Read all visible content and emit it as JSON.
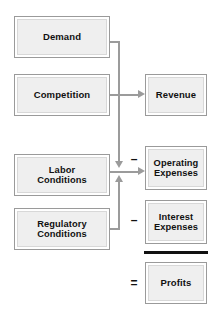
{
  "diagram": {
    "colors": {
      "box_fill": "#efefef",
      "box_border": "#9a9a9a",
      "box_inner_border": "#d8d8d8",
      "connector": "#9b9b9b",
      "text": "#111111",
      "sum_rule": "#111111",
      "background": "#ffffff"
    },
    "drivers": [
      {
        "id": "demand",
        "label": "Demand",
        "lines": [
          "Demand"
        ]
      },
      {
        "id": "competition",
        "label": "Competition",
        "lines": [
          "Competition"
        ]
      },
      {
        "id": "labor-conditions",
        "label": "Labor Conditions",
        "lines": [
          "Labor",
          "Conditions"
        ]
      },
      {
        "id": "regulatory-conditions",
        "label": "Regulatory Conditions",
        "lines": [
          "Regulatory",
          "Conditions"
        ]
      }
    ],
    "outcomes": [
      {
        "id": "revenue",
        "label": "Revenue",
        "lines": [
          "Revenue"
        ],
        "operator": ""
      },
      {
        "id": "operating-expenses",
        "label": "Operating Expenses",
        "lines": [
          "Operating",
          "Expenses"
        ],
        "operator": "–"
      },
      {
        "id": "interest-expenses",
        "label": "Interest Expenses",
        "lines": [
          "Interest",
          "Expenses"
        ],
        "operator": "–"
      },
      {
        "id": "profits",
        "label": "Profits",
        "lines": [
          "Profits"
        ],
        "operator": "="
      }
    ],
    "operators": {
      "minus_operating": "–",
      "minus_interest": "–",
      "equals_profits": "="
    },
    "connections": [
      {
        "from": "demand",
        "to": "operating-expenses",
        "style": "elbow-down-arrow"
      },
      {
        "from": "competition",
        "to": "revenue",
        "style": "straight-arrow"
      },
      {
        "from": "labor-conditions",
        "to": "operating-expenses",
        "style": "straight-arrow"
      },
      {
        "from": "regulatory-conditions",
        "to": "operating-expenses",
        "style": "elbow-up-arrow"
      }
    ]
  }
}
